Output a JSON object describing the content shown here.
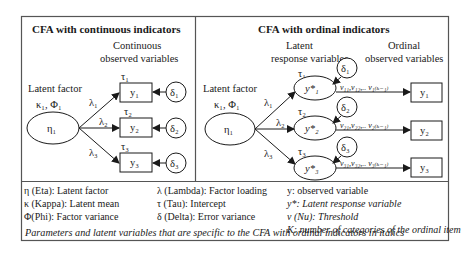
{
  "left_panel": {
    "title": "CFA with continuous indicators",
    "observed_header": [
      "Continuous",
      "observed variables"
    ],
    "factor_label": "Latent factor",
    "factor_params": "κ₁, Φ₁",
    "factor": "η₁",
    "loadings": [
      "λ₁",
      "λ₂",
      "λ₃"
    ],
    "intercepts": [
      "τ₁",
      "τ₂",
      "τ₃"
    ],
    "indicators": [
      "y₁",
      "y₂",
      "y₃"
    ],
    "errors": [
      "δ₁",
      "δ₂",
      "δ₃"
    ]
  },
  "right_panel": {
    "title": "CFA with ordinal indicators",
    "latent_response_header": [
      "Latent",
      "response variables"
    ],
    "observed_header": [
      "Ordinal",
      "observed variables"
    ],
    "factor_label": "Latent factor",
    "factor_params": "κ₁, Φ₁",
    "factor": "η₁",
    "loadings": [
      "λ₁",
      "λ₂",
      "λ₃"
    ],
    "intercepts": [
      "τ₁",
      "τ₂",
      "τ₃"
    ],
    "latent_responses": [
      "y*₁",
      "y*₂",
      "y*₃"
    ],
    "errors": [
      "δ₁",
      "δ₂",
      "δ₃"
    ],
    "thresholds": [
      "ν₁₁,ν₁₂,.. ν₁₍ₖ₋₁₎",
      "ν₂₁,ν₂₂,.. ν₂₍ₖ₋₁₎",
      "ν₃₁,ν₃₂,.. ν₃₍ₖ₋₁₎"
    ],
    "indicators": [
      "y₁",
      "y₂",
      "y₃"
    ]
  },
  "legend": {
    "col1": [
      "η (Eta): Latent factor",
      "κ (Kappa): Latent mean",
      "Φ(Phi): Factor variance"
    ],
    "col2": [
      "λ (Lambda): Factor loading",
      "τ (Tau): Intercept",
      "δ (Delta): Error variance"
    ],
    "col3": [
      {
        "text": "y: observed variable",
        "italic": false
      },
      {
        "text": "y*: Latent response variable",
        "italic": true
      },
      {
        "text": "ν (Nu): Threshold",
        "italic": true
      },
      {
        "text": "K: number of categories of the ordinal item",
        "italic": true
      }
    ],
    "footnote": "Parameters and latent variables that are specific to the CFA with ordinal indicators in italics"
  },
  "colors": {
    "stroke": "#1a1a1a",
    "border": "#555555",
    "background": "#ffffff"
  }
}
